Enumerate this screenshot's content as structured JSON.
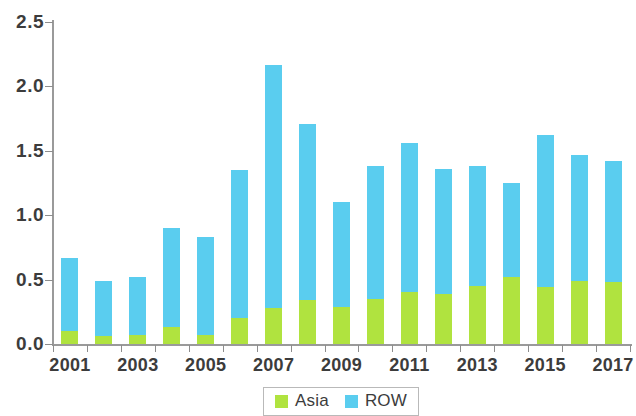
{
  "chart_data": {
    "type": "bar",
    "stacked": true,
    "title": "",
    "subtitle": "",
    "xlabel": "",
    "ylabel": "",
    "ylim": [
      0,
      2.5
    ],
    "ytick_labels": [
      "0.0",
      "0.5",
      "1.0",
      "1.5",
      "2.0",
      "2.5"
    ],
    "ytick_values": [
      0.0,
      0.5,
      1.0,
      1.5,
      2.0,
      2.5
    ],
    "grid": false,
    "legend_position": "bottom-center",
    "categories": [
      "2001",
      "2002",
      "2003",
      "2004",
      "2005",
      "2006",
      "2007",
      "2008",
      "2009",
      "2010",
      "2011",
      "2012",
      "2013",
      "2014",
      "2015",
      "2016",
      "2017"
    ],
    "xtick_labels_shown": [
      "2001",
      "2003",
      "2005",
      "2007",
      "2009",
      "2011",
      "2013",
      "2015",
      "2017"
    ],
    "series": [
      {
        "name": "Asia",
        "color": "#b0e33f",
        "values": [
          0.1,
          0.06,
          0.07,
          0.13,
          0.07,
          0.2,
          0.28,
          0.34,
          0.29,
          0.35,
          0.4,
          0.39,
          0.45,
          0.52,
          0.44,
          0.49,
          0.48
        ]
      },
      {
        "name": "ROW",
        "color": "#5acdef",
        "values": [
          0.57,
          0.43,
          0.45,
          0.77,
          0.76,
          1.15,
          1.89,
          1.37,
          0.81,
          1.03,
          1.16,
          0.97,
          0.93,
          0.73,
          1.18,
          0.98,
          0.94
        ]
      }
    ],
    "totals": [
      0.67,
      0.49,
      0.52,
      0.9,
      0.83,
      1.35,
      2.17,
      1.71,
      1.1,
      1.38,
      1.56,
      1.36,
      1.38,
      1.25,
      1.62,
      1.47,
      1.42
    ]
  },
  "legend": {
    "items": [
      {
        "label": "Asia",
        "color": "#b0e33f"
      },
      {
        "label": "ROW",
        "color": "#5acdef"
      }
    ]
  },
  "colors": {
    "asia": "#b0e33f",
    "row": "#5acdef",
    "axis": "#9a9a9a",
    "text": "#3c3c3c",
    "background": "#ffffff"
  }
}
